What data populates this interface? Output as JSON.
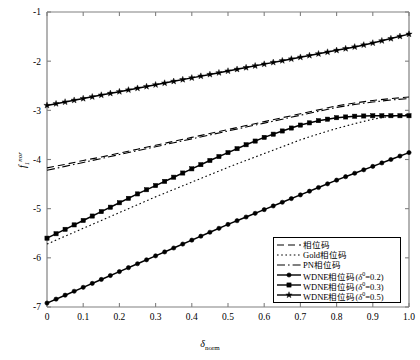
{
  "figure": {
    "background": "#ffffff",
    "axis_color": "#808080",
    "series_color": "#000000"
  },
  "axes": {
    "y_label_main": "f",
    "y_label_sub": "1",
    "y_label_sup": "nor",
    "x_label_main": "δ",
    "x_label_sub": "norm",
    "y_ticks": [
      "-1",
      "-2",
      "-3",
      "-4",
      "-5",
      "-6",
      "-7"
    ],
    "x_ticks": [
      "0",
      "0.1",
      "0.2",
      "0.3",
      "0.4",
      "0.5",
      "0.6",
      "0.7",
      "0.8",
      "0.9",
      "1.0"
    ]
  },
  "legend": {
    "items": [
      {
        "label": "相位码",
        "style": "dashed",
        "marker": "none"
      },
      {
        "label": "Gold相位码",
        "style": "dotted",
        "marker": "none"
      },
      {
        "label": "PN相位码",
        "style": "dashdot",
        "marker": "none"
      },
      {
        "label": "WDNE相位码(δ⁰=0.2)",
        "text_pre": "WDNE相位码(",
        "sym": "δ",
        "sup": "0",
        "text_post": "=0.2)",
        "style": "solid",
        "marker": "circle"
      },
      {
        "label": "WDNE相位码(δ⁰=0.3)",
        "text_pre": "WDNE相位码(",
        "sym": "δ",
        "sup": "0",
        "text_post": "=0.3)",
        "style": "solid",
        "marker": "square"
      },
      {
        "label": "WDNE相位码(δ⁰=0.5)",
        "text_pre": "WDNE相位码(",
        "sym": "δ",
        "sup": "0",
        "text_post": "=0.5)",
        "style": "solid",
        "marker": "star"
      }
    ]
  },
  "chart_data": {
    "type": "line",
    "title": "",
    "xlabel": "δ_norm",
    "ylabel": "f_1^nor",
    "xlim": [
      0,
      1.0
    ],
    "ylim": [
      -7,
      -1
    ],
    "grid": false,
    "legend_position": "lower-right",
    "x": [
      0,
      0.05,
      0.1,
      0.15,
      0.2,
      0.25,
      0.3,
      0.35,
      0.4,
      0.45,
      0.5,
      0.55,
      0.6,
      0.65,
      0.7,
      0.75,
      0.8,
      0.85,
      0.9,
      0.95,
      1.0
    ],
    "series": [
      {
        "name": "相位码",
        "style": "dashed",
        "marker": "none",
        "values": [
          -4.17,
          -4.1,
          -4.02,
          -3.95,
          -3.87,
          -3.79,
          -3.71,
          -3.63,
          -3.55,
          -3.47,
          -3.39,
          -3.31,
          -3.23,
          -3.15,
          -3.07,
          -2.99,
          -2.91,
          -2.85,
          -2.8,
          -2.76,
          -2.73
        ]
      },
      {
        "name": "Gold相位码",
        "style": "dotted",
        "marker": "none",
        "values": [
          -5.72,
          -5.56,
          -5.4,
          -5.24,
          -5.08,
          -4.92,
          -4.76,
          -4.61,
          -4.46,
          -4.31,
          -4.16,
          -4.02,
          -3.88,
          -3.74,
          -3.6,
          -3.48,
          -3.37,
          -3.27,
          -3.18,
          -3.12,
          -3.08
        ]
      },
      {
        "name": "PN相位码",
        "style": "dashdot",
        "marker": "none",
        "values": [
          -4.22,
          -4.14,
          -4.06,
          -3.98,
          -3.9,
          -3.82,
          -3.74,
          -3.66,
          -3.58,
          -3.5,
          -3.42,
          -3.34,
          -3.26,
          -3.18,
          -3.1,
          -3.02,
          -2.94,
          -2.88,
          -2.83,
          -2.79,
          -2.76
        ]
      },
      {
        "name": "WDNE相位码(δ⁰=0.2)",
        "style": "solid",
        "marker": "circle",
        "values": [
          -6.92,
          -6.76,
          -6.6,
          -6.44,
          -6.28,
          -6.12,
          -5.96,
          -5.8,
          -5.64,
          -5.48,
          -5.32,
          -5.17,
          -5.02,
          -4.87,
          -4.72,
          -4.57,
          -4.42,
          -4.28,
          -4.14,
          -4.0,
          -3.86
        ]
      },
      {
        "name": "WDNE相位码(δ⁰=0.3)",
        "style": "solid",
        "marker": "square",
        "values": [
          -5.6,
          -5.42,
          -5.24,
          -5.06,
          -4.88,
          -4.7,
          -4.53,
          -4.36,
          -4.19,
          -4.02,
          -3.86,
          -3.7,
          -3.55,
          -3.42,
          -3.3,
          -3.21,
          -3.15,
          -3.12,
          -3.11,
          -3.11,
          -3.11
        ]
      },
      {
        "name": "WDNE相位码(δ⁰=0.5)",
        "style": "solid",
        "marker": "star",
        "values": [
          -2.9,
          -2.83,
          -2.76,
          -2.69,
          -2.62,
          -2.55,
          -2.48,
          -2.41,
          -2.34,
          -2.27,
          -2.2,
          -2.13,
          -2.06,
          -1.99,
          -1.92,
          -1.85,
          -1.78,
          -1.71,
          -1.63,
          -1.54,
          -1.45
        ]
      }
    ]
  }
}
